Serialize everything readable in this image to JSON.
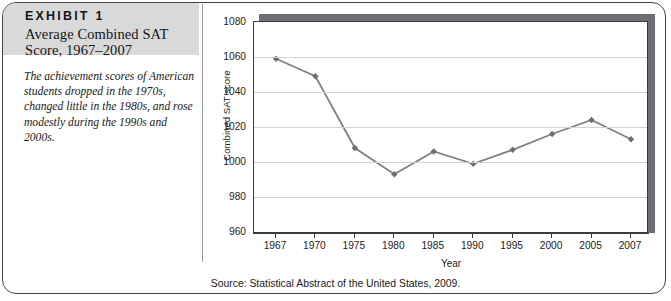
{
  "exhibit": {
    "label": "EXHIBIT 1",
    "title_line1": "Average Combined SAT",
    "title_line2": "Score, 1967–2007",
    "caption": "The achievement scores of American students dropped in the 1970s, changed little in the 1980s, and rose modestly during the 1990s and 2000s.",
    "source": "Source: Statistical Abstract of the United States, 2009."
  },
  "colors": {
    "line": "#808086",
    "marker": "#6e6e74",
    "grid": "#d2d2d6",
    "axis": "#3a3a40",
    "header_bg": "#d9d9d9",
    "frame": "#43434a"
  },
  "chart_data": {
    "type": "line",
    "xlabel": "Year",
    "ylabel": "Combined SAT score",
    "categories": [
      "1967",
      "1970",
      "1975",
      "1980",
      "1985",
      "1990",
      "1995",
      "2000",
      "2005",
      "2007"
    ],
    "values": [
      1059,
      1049,
      1008,
      993,
      1006,
      999,
      1007,
      1016,
      1024,
      1013
    ],
    "ylim": [
      960,
      1080
    ],
    "yticks": [
      960,
      980,
      1000,
      1020,
      1040,
      1060,
      1080
    ],
    "grid": true,
    "legend": "none",
    "marker": "diamond"
  }
}
